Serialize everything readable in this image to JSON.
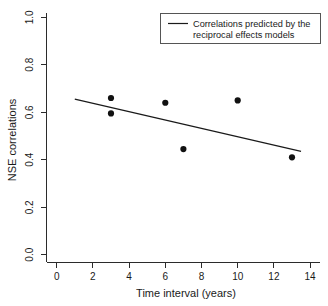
{
  "chart_data": {
    "type": "scatter",
    "title": "",
    "xlabel": "Time interval (years)",
    "ylabel": "NSE correlations",
    "xlim": [
      0,
      14
    ],
    "ylim": [
      0.0,
      1.0
    ],
    "xticks": [
      "0",
      "2",
      "4",
      "6",
      "8",
      "10",
      "12",
      "14"
    ],
    "xtick_values": [
      0,
      2,
      4,
      6,
      8,
      10,
      12,
      14
    ],
    "yticks": [
      "0.0",
      "0.2",
      "0.4",
      "0.6",
      "0.8",
      "1.0"
    ],
    "ytick_values": [
      0.0,
      0.2,
      0.4,
      0.6,
      0.8,
      1.0
    ],
    "grid": false,
    "legend_position": "top-right",
    "series": [
      {
        "name": "Observed NSE correlations",
        "type": "scatter",
        "marker": "filled-circle",
        "color": "#111111",
        "points": [
          {
            "x": 3,
            "y": 0.66
          },
          {
            "x": 3,
            "y": 0.595
          },
          {
            "x": 6,
            "y": 0.64
          },
          {
            "x": 7,
            "y": 0.445
          },
          {
            "x": 10,
            "y": 0.65
          },
          {
            "x": 13,
            "y": 0.41
          }
        ]
      },
      {
        "name": "Correlations predicted by the reciprocal effects models",
        "type": "line",
        "color": "#1a1a1a",
        "points": [
          {
            "x": 1.0,
            "y": 0.655
          },
          {
            "x": 13.5,
            "y": 0.435
          }
        ]
      }
    ],
    "annotations": []
  },
  "legend": {
    "line1": "Correlations predicted by the",
    "line2": "reciprocal effects models"
  }
}
